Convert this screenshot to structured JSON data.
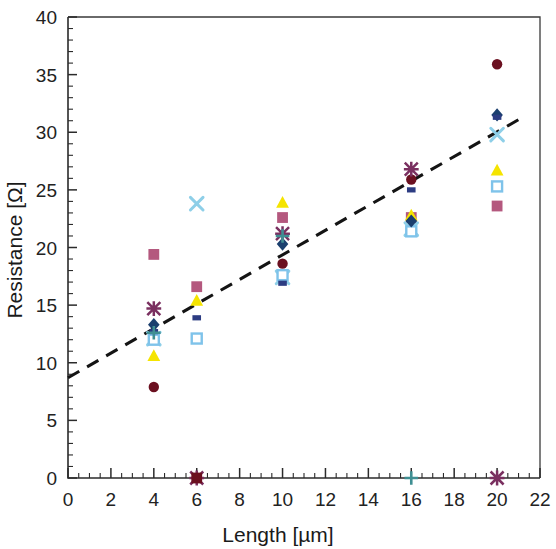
{
  "chart_data": {
    "type": "scatter",
    "title": "",
    "xlabel": "Length [µm]",
    "ylabel": "Resistance [Ω]",
    "xlim": [
      0,
      22
    ],
    "ylim": [
      0,
      40
    ],
    "x_ticks": [
      0,
      2,
      4,
      6,
      8,
      10,
      12,
      14,
      16,
      18,
      20,
      22
    ],
    "y_ticks": [
      0,
      5,
      10,
      15,
      20,
      25,
      30,
      35,
      40
    ],
    "x_minor_step": 0.5,
    "y_minor_step": 1,
    "grid": false,
    "legend": "none",
    "trendline": {
      "label": "linear fit",
      "style": "dashed",
      "color": "#141414",
      "x_start": 0,
      "y_start": 8.7,
      "x_end": 21.1,
      "y_end": 31.2,
      "slope": 1.066,
      "intercept": 8.7
    },
    "series": [
      {
        "name": "series-dark-red-circle",
        "marker": "circle",
        "color": "#6b1020",
        "points": [
          {
            "x": 4,
            "y": 7.9
          },
          {
            "x": 10,
            "y": 18.6
          },
          {
            "x": 16,
            "y": 25.9
          },
          {
            "x": 20,
            "y": 35.9
          }
        ]
      },
      {
        "name": "series-pink-square",
        "marker": "square",
        "color": "#b4587e",
        "points": [
          {
            "x": 4,
            "y": 19.4
          },
          {
            "x": 6,
            "y": 16.6
          },
          {
            "x": 10,
            "y": 22.6
          },
          {
            "x": 16,
            "y": 22.6
          },
          {
            "x": 20,
            "y": 23.6
          }
        ]
      },
      {
        "name": "series-yellow-triangle",
        "marker": "triangle",
        "color": "#f5e400",
        "points": [
          {
            "x": 4,
            "y": 10.6
          },
          {
            "x": 6,
            "y": 15.4
          },
          {
            "x": 10,
            "y": 23.9
          },
          {
            "x": 16,
            "y": 22.8
          },
          {
            "x": 20,
            "y": 26.7
          }
        ]
      },
      {
        "name": "series-light-blue-x",
        "marker": "x",
        "color": "#8ecfe8",
        "points": [
          {
            "x": 4,
            "y": 12.1
          },
          {
            "x": 6,
            "y": 23.8
          },
          {
            "x": 10,
            "y": 17.4
          },
          {
            "x": 16,
            "y": 21.6
          },
          {
            "x": 20,
            "y": 29.8
          }
        ]
      },
      {
        "name": "series-light-blue-open-square",
        "marker": "open-square",
        "color": "#7fc3ea",
        "points": [
          {
            "x": 4,
            "y": 12.0
          },
          {
            "x": 6,
            "y": 12.1
          },
          {
            "x": 10,
            "y": 17.6
          },
          {
            "x": 16,
            "y": 21.4
          },
          {
            "x": 20,
            "y": 25.3
          }
        ]
      },
      {
        "name": "series-navy-diamond",
        "marker": "diamond",
        "color": "#1b3f6e",
        "points": [
          {
            "x": 4,
            "y": 13.3
          },
          {
            "x": 10,
            "y": 20.3
          },
          {
            "x": 16,
            "y": 22.3
          },
          {
            "x": 20,
            "y": 31.5
          }
        ]
      },
      {
        "name": "series-navy-small-square",
        "marker": "small-square",
        "color": "#2c3c82",
        "points": [
          {
            "x": 4,
            "y": 12.7
          },
          {
            "x": 6,
            "y": 13.9
          },
          {
            "x": 10,
            "y": 16.9
          },
          {
            "x": 16,
            "y": 25.0
          },
          {
            "x": 20,
            "y": 31.3
          }
        ]
      },
      {
        "name": "series-purple-asterisk",
        "marker": "asterisk",
        "color": "#7a3060",
        "points": [
          {
            "x": 4,
            "y": 14.7
          },
          {
            "x": 6,
            "y": 0.0
          },
          {
            "x": 10,
            "y": 21.2
          },
          {
            "x": 16,
            "y": 26.8
          },
          {
            "x": 20,
            "y": 0.0
          }
        ]
      },
      {
        "name": "series-teal-plus",
        "marker": "plus",
        "color": "#3f8f93",
        "points": [
          {
            "x": 4,
            "y": 12.6
          },
          {
            "x": 10,
            "y": 21.0
          },
          {
            "x": 16,
            "y": 0.0
          }
        ]
      },
      {
        "name": "series-dark-red-square",
        "marker": "square",
        "color": "#6b1020",
        "points": [
          {
            "x": 6,
            "y": 0.0
          }
        ]
      }
    ]
  },
  "axes": {
    "x_label": "Length [µm]",
    "y_label": "Resistance [Ω]",
    "x_tick_labels": [
      "0",
      "2",
      "4",
      "6",
      "8",
      "10",
      "12",
      "14",
      "16",
      "18",
      "20",
      "22"
    ],
    "y_tick_labels": [
      "0",
      "5",
      "10",
      "15",
      "20",
      "25",
      "30",
      "35",
      "40"
    ]
  },
  "colors": {
    "axis": "#2b2b2b",
    "frame": "#3a3a3a",
    "trendline": "#141414",
    "background": "#ffffff"
  }
}
